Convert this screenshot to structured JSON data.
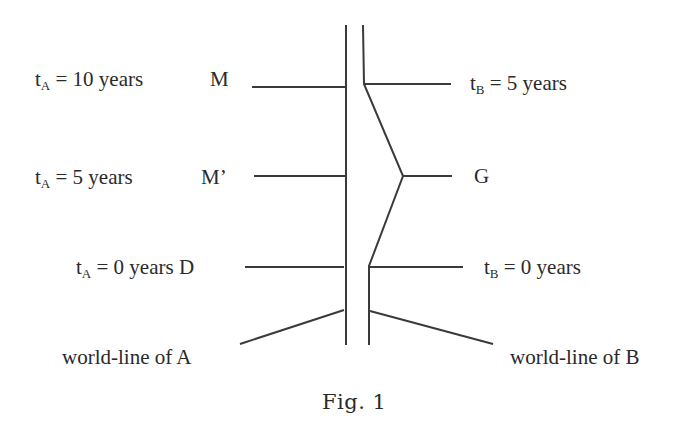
{
  "figure": {
    "caption": "Fig. 1",
    "line_color": "#3a3a3a"
  },
  "labels": {
    "tA_10": {
      "sym": "t",
      "sub": "A",
      "rest": " = 10 years"
    },
    "event_M": "M",
    "tA_5": {
      "sym": "t",
      "sub": "A",
      "rest": " = 5 years"
    },
    "event_Mprime": "M’",
    "tA_0": {
      "sym": "t",
      "sub": "A",
      "rest": " = 0 years D"
    },
    "tB_5": {
      "sym": "t",
      "sub": "B",
      "rest": " = 5 years"
    },
    "event_G": "G",
    "tB_0": {
      "sym": "t",
      "sub": "B",
      "rest": " = 0 years"
    },
    "worldline_A": "world-line of A",
    "worldline_B": "world-line of B"
  }
}
